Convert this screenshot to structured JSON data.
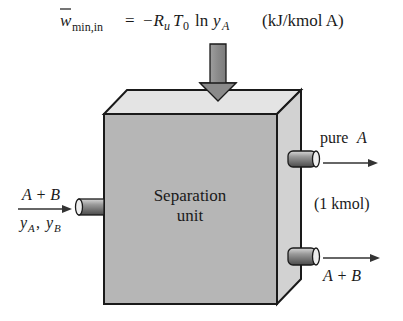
{
  "equation": {
    "lhs_symbol": "w",
    "lhs_subscript": "min,in",
    "equals": "=",
    "rhs_prefix": "−R",
    "rhs_R_sub": "u",
    "rhs_T": "T",
    "rhs_T_sub": "0",
    "rhs_ln": "ln",
    "rhs_y": "y",
    "rhs_y_sub": "A",
    "units": "(kJ/kmol A)"
  },
  "unit": {
    "label_line1": "Separation",
    "label_line2": "unit"
  },
  "inlet": {
    "label_top": "A + B",
    "label_bottom_y1": "y",
    "label_bottom_s1": "A",
    "label_bottom_comma": ", ",
    "label_bottom_y2": "y",
    "label_bottom_s2": "B"
  },
  "outlet_pure": {
    "label": "pure",
    "species": "A",
    "amount": "(1 kmol)"
  },
  "outlet_mix": {
    "label": "A + B"
  },
  "colors": {
    "front_face": "#b4b4b4",
    "top_face": "#e2e2e2",
    "side_face": "#d0d0d0",
    "outline": "#1a1a1a",
    "arrow_fill": "#8c8c8c"
  }
}
